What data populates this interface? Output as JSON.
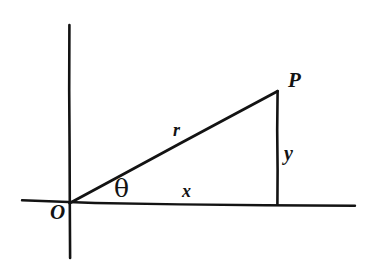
{
  "figure": {
    "type": "geometry-diagram",
    "background_color": "#ffffff",
    "ink_color": "#131313",
    "labels": {
      "origin": "O",
      "point": "P",
      "radius": "r",
      "horizontal_leg": "x",
      "vertical_leg": "y",
      "angle": "θ"
    },
    "axes": {
      "x_axis": {
        "x1": 22,
        "y1": 200,
        "x2": 355,
        "y2": 206
      },
      "y_axis": {
        "x1": 69,
        "y1": 25,
        "x2": 70,
        "y2": 258
      }
    },
    "geometry": {
      "origin_point": {
        "x": 69,
        "y": 203
      },
      "p_point": {
        "x": 277,
        "y": 91
      },
      "foot_point": {
        "x": 277,
        "y": 204
      },
      "hypotenuse": {
        "x1": 69,
        "y1": 203,
        "x2": 277,
        "y2": 91
      },
      "vertical_leg": {
        "x1": 277,
        "y1": 91,
        "x2": 277,
        "y2": 204
      }
    }
  }
}
